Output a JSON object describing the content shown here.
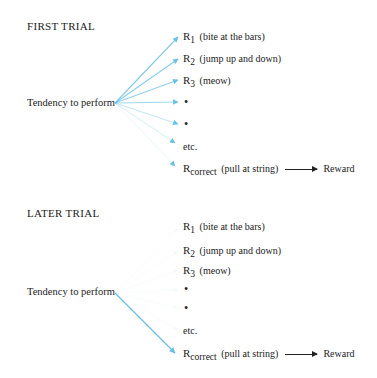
{
  "colors": {
    "arrow": "#7cc6e4",
    "text": "#222222",
    "background": "#ffffff"
  },
  "first_trial": {
    "title": "FIRST TRIAL",
    "source_label": "Tendency to perform",
    "responses": [
      {
        "r": "R",
        "sub": "1",
        "text": "(bite at the bars)",
        "arrow_opacity": 0.85
      },
      {
        "r": "R",
        "sub": "2",
        "text": "(jump up and down)",
        "arrow_opacity": 0.8
      },
      {
        "r": "R",
        "sub": "3",
        "text": "(meow)",
        "arrow_opacity": 0.75
      },
      {
        "bullet": "•",
        "arrow_opacity": 0.65
      },
      {
        "bullet": "•",
        "arrow_opacity": 0.45
      },
      {
        "text": "etc.",
        "arrow_opacity": 0.25
      },
      {
        "r": "R",
        "sub": "correct",
        "text": "(pull at string)",
        "outcome": "Reward",
        "arrow_opacity": 0.1
      }
    ]
  },
  "later_trial": {
    "title": "LATER TRIAL",
    "source_label": "Tendency to perform",
    "responses": [
      {
        "r": "R",
        "sub": "1",
        "text": "(bite at the bars)",
        "arrow_opacity": 0.05
      },
      {
        "r": "R",
        "sub": "2",
        "text": "(jump up and down)",
        "arrow_opacity": 0.05
      },
      {
        "r": "R",
        "sub": "3",
        "text": "(meow)",
        "arrow_opacity": 0.05
      },
      {
        "bullet": "•",
        "arrow_opacity": 0.05
      },
      {
        "bullet": "•",
        "arrow_opacity": 0.05
      },
      {
        "text": "etc.",
        "arrow_opacity": 0.05
      },
      {
        "r": "R",
        "sub": "correct",
        "text": "(pull at string)",
        "outcome": "Reward",
        "arrow_opacity": 0.95
      }
    ]
  }
}
